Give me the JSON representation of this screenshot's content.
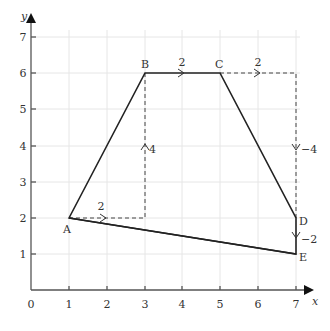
{
  "diagram": {
    "type": "coordinate-grid-polygon",
    "axes": {
      "x_label": "x",
      "y_label": "y",
      "origin_label": "0",
      "x_ticks": [
        "1",
        "2",
        "3",
        "4",
        "5",
        "6",
        "7"
      ],
      "y_ticks": [
        "1",
        "2",
        "3",
        "4",
        "5",
        "6",
        "7"
      ]
    },
    "points": [
      {
        "name": "A",
        "x": 1,
        "y": 2
      },
      {
        "name": "B",
        "x": 3,
        "y": 6
      },
      {
        "name": "C",
        "x": 5,
        "y": 6
      },
      {
        "name": "D",
        "x": 7,
        "y": 2
      },
      {
        "name": "E",
        "x": 7,
        "y": 1
      }
    ],
    "vector_labels": {
      "a_right": "2",
      "up_to_b": "4",
      "b_to_c": "2",
      "c_right": "2",
      "down_to_d": "−4",
      "d_to_e": "−2"
    },
    "colors": {
      "line": "#222222",
      "grid": "#e4e4e4",
      "axis": "#555555",
      "text": "#333333"
    }
  }
}
